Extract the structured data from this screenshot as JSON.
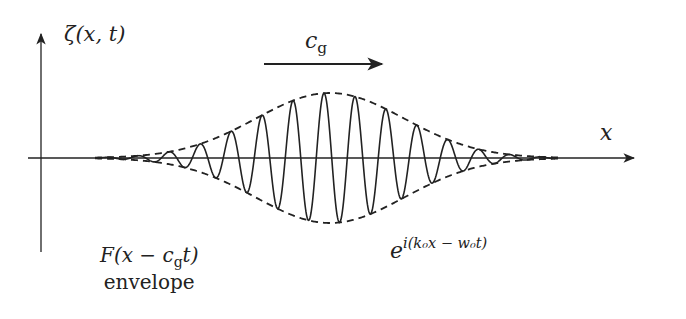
{
  "diagram": {
    "y_axis_label": {
      "func": "ζ",
      "args": "(x, t)"
    },
    "x_axis_label": "x",
    "group_velocity_label": {
      "base": "c",
      "sub": "g"
    },
    "envelope_label": {
      "expr_pre": "F(x − c",
      "sub": "g",
      "expr_post": "t)",
      "caption": "envelope"
    },
    "carrier_label": {
      "base": "e",
      "sup": "i(k₀x − w₀t)"
    },
    "colors": {
      "line": "#222222",
      "background": "#ffffff"
    },
    "geometry": {
      "origin": [
        41,
        158
      ],
      "x_axis_end": 634,
      "y_axis_top": 34,
      "y_axis_bottom": 252,
      "packet_center_x": 330,
      "packet_amplitude_px": 65,
      "packet_sigma_px": 105,
      "carrier_period_px": 31,
      "arrow_cg": {
        "x1": 264,
        "x2": 382,
        "y": 64
      }
    }
  }
}
